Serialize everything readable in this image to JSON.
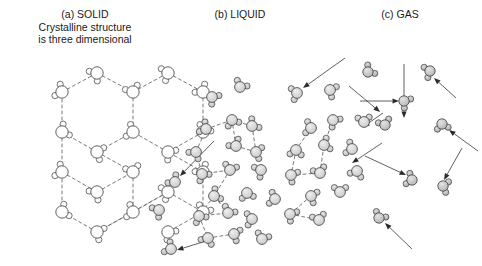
{
  "figure": {
    "width": 482,
    "height": 266,
    "background": "#ffffff"
  },
  "captions": {
    "solid": "(a) SOLID\nCrystalline structure\nis three dimensional",
    "liquid": "(b) LIQUID",
    "gas": "(c) GAS"
  },
  "style": {
    "oxygen_fill_solid": "#fbfbfb",
    "oxygen_fill_liquid": "#c9c9c9",
    "oxygen_fill_gas": "#b4b4b4",
    "hydrogen_fill_solid": "#f4f4f4",
    "hydrogen_fill_liquid": "#bcbcbc",
    "hydrogen_fill_gas": "#a8a8a8",
    "outline": "#3c3c3c",
    "bond_color": "#6b6b6b",
    "arrow_color": "#2b2b2b",
    "text_color": "#1a1a1a",
    "oxygen_radius_solid": 6.2,
    "oxygen_radius_liquid": 5.4,
    "oxygen_radius_gas": 5.2,
    "hydrogen_radius": 3.1
  },
  "panels": {
    "solid": {
      "label": "(a) SOLID",
      "molecules": [
        {
          "x": 62,
          "y": 92,
          "rot": 205
        },
        {
          "x": 97,
          "y": 73,
          "rot": 140
        },
        {
          "x": 133,
          "y": 92,
          "rot": 250
        },
        {
          "x": 133,
          "y": 132,
          "rot": 200
        },
        {
          "x": 97,
          "y": 152,
          "rot": 20
        },
        {
          "x": 62,
          "y": 132,
          "rot": 330
        },
        {
          "x": 168,
          "y": 73,
          "rot": 160
        },
        {
          "x": 203,
          "y": 92,
          "rot": 230
        },
        {
          "x": 203,
          "y": 132,
          "rot": 300
        },
        {
          "x": 168,
          "y": 152,
          "rot": 40
        },
        {
          "x": 62,
          "y": 172,
          "rot": 205
        },
        {
          "x": 97,
          "y": 192,
          "rot": 135
        },
        {
          "x": 133,
          "y": 172,
          "rot": 255
        },
        {
          "x": 133,
          "y": 212,
          "rot": 195
        },
        {
          "x": 97,
          "y": 232,
          "rot": 25
        },
        {
          "x": 62,
          "y": 212,
          "rot": 335
        },
        {
          "x": 168,
          "y": 192,
          "rot": 160
        },
        {
          "x": 203,
          "y": 172,
          "rot": 235
        },
        {
          "x": 203,
          "y": 212,
          "rot": 295
        },
        {
          "x": 168,
          "y": 232,
          "rot": 45
        }
      ],
      "bonds": [
        [
          0,
          1
        ],
        [
          1,
          2
        ],
        [
          2,
          3
        ],
        [
          3,
          4
        ],
        [
          4,
          5
        ],
        [
          5,
          0
        ],
        [
          2,
          6
        ],
        [
          6,
          7
        ],
        [
          7,
          8
        ],
        [
          8,
          9
        ],
        [
          9,
          3
        ],
        [
          5,
          10
        ],
        [
          10,
          11
        ],
        [
          11,
          12
        ],
        [
          12,
          13
        ],
        [
          13,
          14
        ],
        [
          14,
          15
        ],
        [
          15,
          10
        ],
        [
          4,
          12
        ],
        [
          13,
          16
        ],
        [
          16,
          18
        ],
        [
          18,
          17
        ],
        [
          17,
          9
        ],
        [
          16,
          14
        ],
        [
          18,
          19
        ]
      ]
    },
    "liquid": {
      "label": "(b) LIQUID",
      "molecules": [
        {
          "x": 212,
          "y": 97,
          "rot": 40
        },
        {
          "x": 240,
          "y": 87,
          "rot": 300
        },
        {
          "x": 297,
          "y": 93,
          "rot": 165
        },
        {
          "x": 330,
          "y": 90,
          "rot": 25
        },
        {
          "x": 206,
          "y": 129,
          "rot": 210
        },
        {
          "x": 232,
          "y": 120,
          "rot": 70
        },
        {
          "x": 252,
          "y": 126,
          "rot": 320
        },
        {
          "x": 311,
          "y": 128,
          "rot": 190
        },
        {
          "x": 333,
          "y": 120,
          "rot": 45
        },
        {
          "x": 364,
          "y": 122,
          "rot": 265
        },
        {
          "x": 196,
          "y": 152,
          "rot": 125
        },
        {
          "x": 236,
          "y": 146,
          "rot": 235
        },
        {
          "x": 256,
          "y": 152,
          "rot": 15
        },
        {
          "x": 296,
          "y": 150,
          "rot": 95
        },
        {
          "x": 324,
          "y": 145,
          "rot": 340
        },
        {
          "x": 352,
          "y": 149,
          "rot": 200
        },
        {
          "x": 202,
          "y": 174,
          "rot": 55
        },
        {
          "x": 230,
          "y": 170,
          "rot": 285
        },
        {
          "x": 261,
          "y": 170,
          "rot": 150
        },
        {
          "x": 291,
          "y": 175,
          "rot": 30
        },
        {
          "x": 320,
          "y": 173,
          "rot": 250
        },
        {
          "x": 357,
          "y": 171,
          "rot": 110
        },
        {
          "x": 175,
          "y": 182,
          "rot": 225
        },
        {
          "x": 214,
          "y": 196,
          "rot": 330
        },
        {
          "x": 247,
          "y": 193,
          "rot": 80
        },
        {
          "x": 275,
          "y": 199,
          "rot": 195
        },
        {
          "x": 311,
          "y": 196,
          "rot": 20
        },
        {
          "x": 340,
          "y": 192,
          "rot": 270
        },
        {
          "x": 159,
          "y": 210,
          "rot": 145
        },
        {
          "x": 199,
          "y": 216,
          "rot": 60
        },
        {
          "x": 228,
          "y": 213,
          "rot": 300
        },
        {
          "x": 252,
          "y": 219,
          "rot": 175
        },
        {
          "x": 290,
          "y": 214,
          "rot": 35
        },
        {
          "x": 319,
          "y": 220,
          "rot": 255
        },
        {
          "x": 208,
          "y": 238,
          "rot": 115
        },
        {
          "x": 234,
          "y": 234,
          "rot": 20
        },
        {
          "x": 262,
          "y": 239,
          "rot": 290
        },
        {
          "x": 171,
          "y": 249,
          "rot": 210
        }
      ],
      "bonds": [
        [
          4,
          5
        ],
        [
          5,
          6
        ],
        [
          6,
          12
        ],
        [
          12,
          11
        ],
        [
          11,
          5
        ],
        [
          10,
          4
        ],
        [
          10,
          16
        ],
        [
          16,
          17
        ],
        [
          17,
          23
        ],
        [
          7,
          13
        ],
        [
          13,
          19
        ],
        [
          19,
          20
        ],
        [
          20,
          14
        ],
        [
          14,
          8
        ],
        [
          29,
          30
        ],
        [
          30,
          23
        ],
        [
          23,
          29
        ],
        [
          29,
          34
        ],
        [
          34,
          35
        ],
        [
          26,
          32
        ],
        [
          32,
          33
        ]
      ],
      "arrows": [
        {
          "x1": 345,
          "y1": 58,
          "x2": 303,
          "y2": 88
        },
        {
          "x1": 214,
          "y1": 141,
          "x2": 180,
          "y2": 176
        },
        {
          "x1": 382,
          "y1": 143,
          "x2": 352,
          "y2": 163
        },
        {
          "x1": 206,
          "y1": 241,
          "x2": 177,
          "y2": 250
        },
        {
          "x1": 383,
          "y1": 113,
          "x2": 363,
          "y2": 127
        }
      ]
    },
    "gas": {
      "label": "(c) GAS",
      "molecules": [
        {
          "x": 368,
          "y": 72,
          "rot": 320
        },
        {
          "x": 430,
          "y": 71,
          "rot": 160
        },
        {
          "x": 404,
          "y": 101,
          "rot": 35
        },
        {
          "x": 385,
          "y": 125,
          "rot": 250
        },
        {
          "x": 442,
          "y": 124,
          "rot": 80
        },
        {
          "x": 412,
          "y": 180,
          "rot": 200
        },
        {
          "x": 443,
          "y": 186,
          "rot": 15
        },
        {
          "x": 379,
          "y": 218,
          "rot": 300
        }
      ],
      "arrows": [
        {
          "x1": 456,
          "y1": 98,
          "x2": 434,
          "y2": 78
        },
        {
          "x1": 349,
          "y1": 86,
          "x2": 380,
          "y2": 112
        },
        {
          "x1": 360,
          "y1": 101,
          "x2": 399,
          "y2": 101
        },
        {
          "x1": 404,
          "y1": 64,
          "x2": 404,
          "y2": 118
        },
        {
          "x1": 478,
          "y1": 151,
          "x2": 449,
          "y2": 130
        },
        {
          "x1": 365,
          "y1": 156,
          "x2": 406,
          "y2": 175
        },
        {
          "x1": 462,
          "y1": 148,
          "x2": 444,
          "y2": 180
        },
        {
          "x1": 412,
          "y1": 249,
          "x2": 385,
          "y2": 223
        }
      ]
    }
  }
}
